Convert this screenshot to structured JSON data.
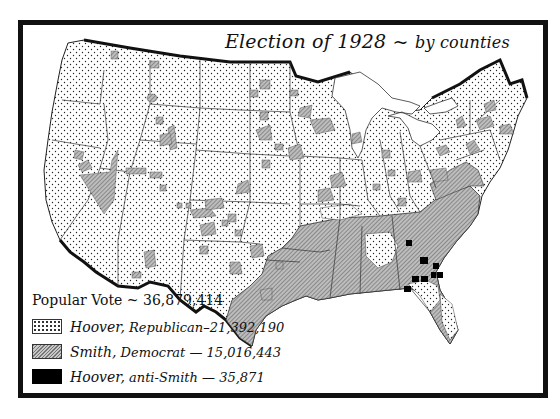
{
  "title": {
    "main": "Election of 1928 ~",
    "sub": "by counties"
  },
  "legend": {
    "total_label": "Popular Vote ~ 36,879,414",
    "items": [
      {
        "candidate": "Hoover,",
        "party": "Republican",
        "votes": "–21,392,190",
        "pattern": "dotted",
        "color": "#ffffff"
      },
      {
        "candidate": "Smith,",
        "party": "Democrat",
        "votes": "— 15,016,443",
        "pattern": "hatched",
        "color": "#a0a0a0"
      },
      {
        "candidate": "Hoover,",
        "party": "anti-Smith",
        "votes": "— 35,871",
        "pattern": "solid",
        "color": "#000000"
      }
    ]
  },
  "colors": {
    "frame": "#111111",
    "republican_fill": "#ffffff",
    "democrat_fill": "#a8a8a8",
    "anti_smith_fill": "#000000"
  }
}
